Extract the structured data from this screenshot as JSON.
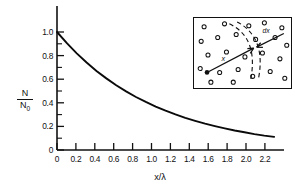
{
  "figure": {
    "kind": "scientific-plot",
    "background_color": "#ffffff",
    "ink_color": "#111111"
  },
  "axes": {
    "y_label_numerator": "N",
    "y_label_denominator": "N",
    "y_label_denominator_sub": "0",
    "x_label": "x/λ",
    "y_ticks": [
      "0",
      "0.2",
      "0.4",
      "0.6",
      "0.8",
      "1.0"
    ],
    "x_ticks": [
      "0",
      "0.2",
      "0.4",
      "0.6",
      "0.8",
      "1.0",
      "1.2",
      "1.4",
      "1.6",
      "1.8",
      "2.0",
      "2.2"
    ]
  },
  "inset": {
    "label_x": "x",
    "label_dx": "dx",
    "circle_count": 24,
    "border_color": "#111111"
  },
  "chart_data": {
    "type": "line",
    "title": "",
    "xlabel": "x/λ",
    "ylabel": "N/N0",
    "xlim": [
      0,
      2.3
    ],
    "ylim": [
      0,
      1.08
    ],
    "grid": false,
    "legend": null,
    "x_tick_values": [
      0,
      0.2,
      0.4,
      0.6,
      0.8,
      1.0,
      1.2,
      1.4,
      1.6,
      1.8,
      2.0,
      2.2
    ],
    "x_tick_labels": [
      "0",
      "0.2",
      "0.4",
      "0.6",
      "0.8",
      "1.0",
      "1.2",
      "1.4",
      "1.6",
      "1.8",
      "2.0",
      "2.2"
    ],
    "y_tick_values": [
      0,
      0.2,
      0.4,
      0.6,
      0.8,
      1.0
    ],
    "y_tick_labels": [
      "0",
      "0.2",
      "0.4",
      "0.6",
      "0.8",
      "1.0"
    ],
    "y_minor_tick_values": [
      0.1,
      0.3,
      0.5,
      0.7,
      0.9
    ],
    "series": [
      {
        "name": "N/N0 = exp(-x/lambda)",
        "x": [
          0,
          0.1,
          0.2,
          0.3,
          0.4,
          0.5,
          0.6,
          0.7,
          0.8,
          0.9,
          1.0,
          1.1,
          1.2,
          1.3,
          1.4,
          1.5,
          1.6,
          1.7,
          1.8,
          1.9,
          2.0,
          2.1,
          2.2
        ],
        "y": [
          1.0,
          0.905,
          0.819,
          0.741,
          0.67,
          0.607,
          0.549,
          0.497,
          0.449,
          0.407,
          0.368,
          0.333,
          0.301,
          0.273,
          0.247,
          0.223,
          0.202,
          0.183,
          0.165,
          0.15,
          0.135,
          0.122,
          0.111
        ]
      }
    ]
  }
}
